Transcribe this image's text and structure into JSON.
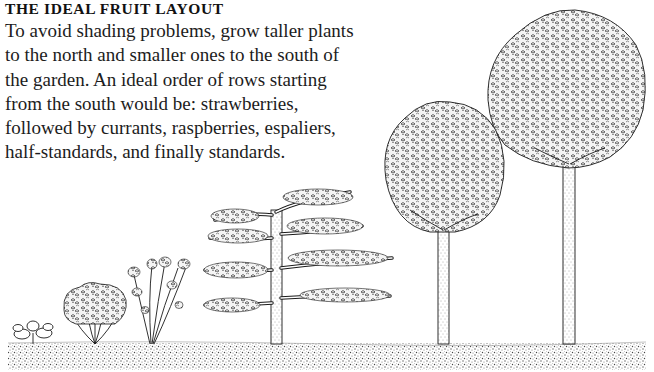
{
  "heading": "THE IDEAL FRUIT LAYOUT",
  "paragraph_lines": [
    "To avoid shading problems, grow taller plants",
    "to the north and smaller ones to the south of",
    "the garden. An ideal order of rows starting",
    "from the south would be: strawberries,",
    "followed by currants, raspberries, espaliers,",
    "half-standards, and finally standards."
  ],
  "illustration": {
    "style": "pen-and-ink",
    "ink_color": "#1a1a1a",
    "ground_color": "#8a8a8a",
    "plants_left_to_right": [
      "strawberry",
      "currant",
      "raspberry",
      "espalier",
      "half-standard",
      "standard"
    ]
  }
}
